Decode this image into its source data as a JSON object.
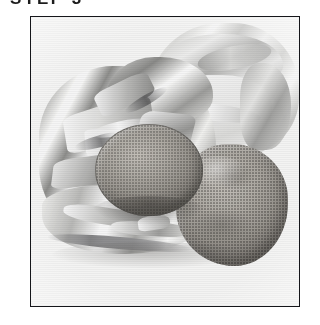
{
  "caption": {
    "text": "STEP 3",
    "note": "bold uppercase heading, clipped by the top edge of the screenshot"
  },
  "photo": {
    "alt": "Black and white halftone photograph of baked potatoes wrapped in crumpled aluminum foil",
    "frame_border_color": "#15161a",
    "background_color": "#ffffff",
    "paper_color": "#fbfbfa",
    "elements": [
      {
        "name": "crumpled-foil-main",
        "label": "Crumpled aluminum foil wrap (left/centre)"
      },
      {
        "name": "foil-packet-upper-right",
        "label": "Second foil packet, upper right"
      },
      {
        "name": "foil-skirt",
        "label": "Torn foil skirt along bottom edge"
      },
      {
        "name": "potato-centre",
        "label": "Round potato resting in opened foil"
      },
      {
        "name": "potato-lower-right",
        "label": "Large potato, lower right"
      }
    ],
    "tones": {
      "foil_highlight": "#ffffff",
      "foil_midtone": "#b4b4b2",
      "foil_shadow": "#6e6e70",
      "potato_light": "#cdc9c2",
      "potato_mid": "#a6a29b",
      "potato_dark": "#7b7771"
    }
  }
}
